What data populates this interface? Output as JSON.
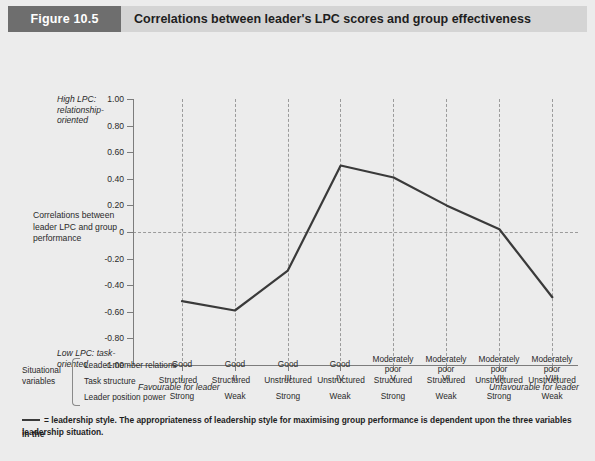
{
  "figure": {
    "badge": "Figure 10.5",
    "title": "Correlations between leader's LPC scores and group effectiveness",
    "badge_color": "#6e6e6e",
    "bar_color": "#d4d4d4"
  },
  "axis_notes": {
    "high_lpc": "High LPC: relationship-oriented",
    "low_lpc": "Low LPC: task-oriented",
    "favourable": "Favourable for leader",
    "unfavourable": "Unfavourable for leader",
    "ylabel": "Correlations between leader LPC and group performance"
  },
  "chart_data": {
    "type": "line",
    "title": "Correlations between leader's LPC scores and group effectiveness",
    "xlabel": "",
    "ylabel": "Correlations between leader LPC and group performance",
    "categories": [
      "I",
      "II",
      "III",
      "IV",
      "V",
      "VI",
      "VII",
      "VIII"
    ],
    "values": [
      -0.52,
      -0.59,
      -0.29,
      0.5,
      0.41,
      0.2,
      0.02,
      -0.49
    ],
    "ylim": [
      -1.0,
      1.0
    ],
    "yticks": [
      1.0,
      0.8,
      0.6,
      0.4,
      0.2,
      0,
      -0.2,
      -0.4,
      -0.6,
      -0.8,
      -1.0
    ],
    "ytick_labels": [
      "1.00",
      "0.80",
      "0.60",
      "0.40",
      "0.20",
      "0",
      "-0.20",
      "-0.40",
      "-0.60",
      "-0.80",
      "-1.00"
    ],
    "grid": "vertical-dashed-and-zero-line",
    "legend": [
      "leadership style"
    ],
    "line_color": "#3a3a3a"
  },
  "situational": {
    "group_label": "Situational variables",
    "rows": [
      {
        "name": "Leader-member relations",
        "cells": [
          "Good",
          "Good",
          "Good",
          "Good",
          "Moderately poor",
          "Moderately poor",
          "Moderately poor",
          "Moderately poor"
        ]
      },
      {
        "name": "Task structure",
        "cells": [
          "Structured",
          "Structured",
          "Unstructured",
          "Unstructured",
          "Structured",
          "Structured",
          "Unstructured",
          "Unstructured"
        ]
      },
      {
        "name": "Leader position power",
        "cells": [
          "Strong",
          "Weak",
          "Strong",
          "Weak",
          "Strong",
          "Weak",
          "Strong",
          "Weak"
        ]
      }
    ]
  },
  "footnote": {
    "line1": "= leadership style.  The appropriateness of leadership style for maximising group performance is dependent upon the three variables in the",
    "line2": "leadership situation."
  }
}
